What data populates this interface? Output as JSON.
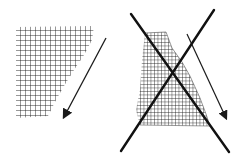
{
  "diagram": {
    "panels": [
      {
        "id": "correct",
        "shape": "cross-hatched tapering patch",
        "arrow": "diagonal arrow pointing down-left",
        "crossed_out": false
      },
      {
        "id": "incorrect",
        "shape": "dense cross-hatched tapering patch",
        "arrow": "diagonal arrow pointing down-right",
        "crossed_out": true
      }
    ],
    "colors": {
      "ink": "#1a1a1a",
      "background": "#ffffff"
    }
  }
}
